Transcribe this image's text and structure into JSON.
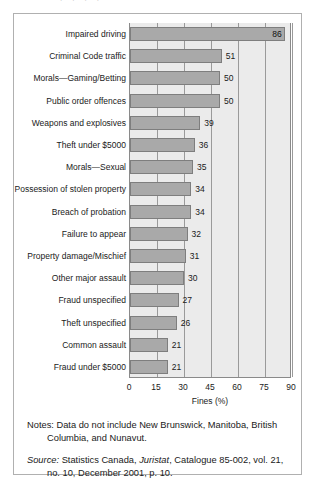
{
  "frame": {
    "top_bleed_artifact": "...."
  },
  "chart_data": {
    "type": "bar",
    "orientation": "horizontal",
    "title": "",
    "xlabel": "Fines (%)",
    "ylabel": "",
    "xlim": [
      0,
      90
    ],
    "xticks": [
      0,
      15,
      30,
      45,
      60,
      75,
      90
    ],
    "grid": true,
    "legend": null,
    "categories": [
      "Impaired driving",
      "Criminal Code traffic",
      "Morals—Gaming/Betting",
      "Public order offences",
      "Weapons and explosives",
      "Theft under $5000",
      "Morals—Sexual",
      "Possession of stolen property",
      "Breach of probation",
      "Failure to appear",
      "Property damage/Mischief",
      "Other major assault",
      "Fraud unspecified",
      "Theft unspecified",
      "Common assault",
      "Fraud under $5000"
    ],
    "values": [
      86,
      51,
      50,
      50,
      39,
      36,
      35,
      34,
      34,
      32,
      31,
      30,
      27,
      26,
      21,
      21
    ],
    "value_label_position": [
      "inside",
      "outside",
      "outside",
      "outside",
      "outside",
      "outside",
      "outside",
      "outside",
      "outside",
      "outside",
      "outside",
      "outside",
      "outside",
      "outside",
      "outside",
      "outside"
    ],
    "colors": {
      "bar_fill": "#a9a9a9",
      "bar_stroke": "#7e7e7e",
      "plot_background": "#ebebeb",
      "gridline": "#9a9a9a",
      "axis": "#8a8a8a",
      "text": "#1a1a1a"
    }
  },
  "footnotes": {
    "notes_label": "Notes:",
    "notes_text": " Data do not include New Brunswick, Manitoba, British Columbia, and Nunavut.",
    "source_label": "Source:",
    "source_text_1": " Statistics Canada, ",
    "source_italic": "Juristat",
    "source_text_2": ", Catalogue 85-002, vol. 21, no. 10, December 2001, p. 10."
  }
}
